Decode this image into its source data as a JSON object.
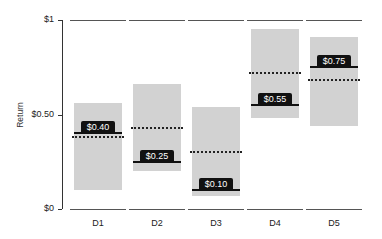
{
  "chart_data": {
    "type": "bar",
    "subtype": "floating range bars with marked values",
    "title": "",
    "xlabel": "",
    "ylabel": "Return",
    "ylim": [
      0,
      1
    ],
    "y_ticks": [
      "$0",
      "$0.50",
      "$1"
    ],
    "categories": [
      "D1",
      "D2",
      "D3",
      "D4",
      "D5"
    ],
    "series": [
      {
        "name": "range_low",
        "values": [
          0.1,
          0.2,
          0.07,
          0.48,
          0.44
        ]
      },
      {
        "name": "range_high",
        "values": [
          0.56,
          0.66,
          0.54,
          0.95,
          0.91
        ]
      },
      {
        "name": "labeled_value (solid line)",
        "values": [
          0.4,
          0.25,
          0.1,
          0.55,
          0.75
        ]
      },
      {
        "name": "dotted_line",
        "values": [
          0.38,
          0.43,
          0.3,
          0.72,
          0.68
        ]
      }
    ],
    "labels": [
      "$0.40",
      "$0.25",
      "$0.10",
      "$0.55",
      "$0.75"
    ],
    "grid": false,
    "legend": null
  },
  "axis": {
    "y_title": "Return",
    "ticks": [
      {
        "label": "$1",
        "value": 1
      },
      {
        "label": "$0.50",
        "value": 0.5
      },
      {
        "label": "$0",
        "value": 0
      }
    ]
  },
  "columns": [
    {
      "name": "D1",
      "low": 0.1,
      "high": 0.56,
      "value": 0.4,
      "label": "$0.40",
      "dotted": 0.38
    },
    {
      "name": "D2",
      "low": 0.2,
      "high": 0.66,
      "value": 0.25,
      "label": "$0.25",
      "dotted": 0.43
    },
    {
      "name": "D3",
      "low": 0.07,
      "high": 0.54,
      "value": 0.1,
      "label": "$0.10",
      "dotted": 0.3
    },
    {
      "name": "D4",
      "low": 0.48,
      "high": 0.95,
      "value": 0.55,
      "label": "$0.55",
      "dotted": 0.72
    },
    {
      "name": "D5",
      "low": 0.44,
      "high": 0.91,
      "value": 0.75,
      "label": "$0.75",
      "dotted": 0.68
    }
  ],
  "colors": {
    "bar": "#d2d2d2",
    "value_line": "#111111",
    "dotted_line": "#222222",
    "axis": "#333333"
  }
}
